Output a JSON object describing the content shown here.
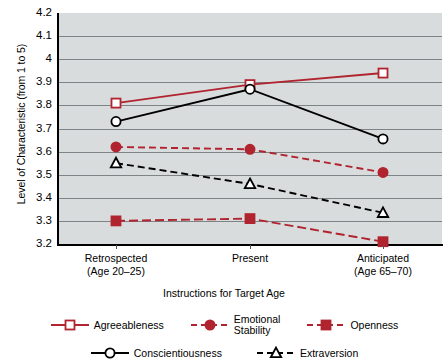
{
  "chart_data": {
    "type": "line",
    "title": "",
    "xlabel": "Instructions for Target Age",
    "ylabel": "Level of Characteristic (from 1 to 5)",
    "categories": [
      "Retrospected\n(Age 20–25)",
      "Present",
      "Anticipated\n(Age 65–70)"
    ],
    "category_labels": [
      {
        "line1": "Retrospected",
        "line2": "(Age 20–25)"
      },
      {
        "line1": "Present",
        "line2": ""
      },
      {
        "line1": "Anticipated",
        "line2": "(Age 65–70)"
      }
    ],
    "ylim": [
      3.2,
      4.2
    ],
    "ytick_labels": [
      "4.2",
      "4.1",
      "4",
      "3.9",
      "3.8",
      "3.7",
      "3.6",
      "3.5",
      "3.4",
      "3.3",
      "3.2"
    ],
    "ytick_values": [
      4.2,
      4.1,
      4.0,
      3.9,
      3.8,
      3.7,
      3.6,
      3.5,
      3.4,
      3.3,
      3.2
    ],
    "grid": true,
    "legend_position": "bottom",
    "plot_background": "#d9dcdc",
    "series": [
      {
        "name": "Agreeableness",
        "values": [
          3.81,
          3.89,
          3.94
        ],
        "color": "#b02430",
        "marker": "open-square",
        "line_style": "solid"
      },
      {
        "name": "Emotional Stability",
        "values": [
          3.62,
          3.61,
          3.51
        ],
        "color": "#b02430",
        "marker": "filled-circle",
        "line_style": "dashed"
      },
      {
        "name": "Openness",
        "values": [
          3.3,
          3.31,
          3.21
        ],
        "color": "#b02430",
        "marker": "filled-square",
        "line_style": "dash-dot"
      },
      {
        "name": "Conscientiousness",
        "values": [
          3.73,
          3.87,
          3.655
        ],
        "color": "#000000",
        "marker": "open-circle",
        "line_style": "solid"
      },
      {
        "name": "Extraversion",
        "values": [
          3.55,
          3.46,
          3.335
        ],
        "color": "#000000",
        "marker": "open-triangle",
        "line_style": "dashed"
      }
    ]
  },
  "legend": {
    "row1": [
      {
        "label": "Agreeableness",
        "series_index": 0
      },
      {
        "label": "Emotional\nStability",
        "series_index": 1
      },
      {
        "label": "Openness",
        "series_index": 2
      }
    ],
    "row2": [
      {
        "label": "Conscientiousness",
        "series_index": 3
      },
      {
        "label": "Extraversion",
        "series_index": 4
      }
    ]
  },
  "colors": {
    "red": "#b02430",
    "black": "#000000",
    "plot_bg": "#d9dcdc",
    "gridline": "#7e8486"
  }
}
